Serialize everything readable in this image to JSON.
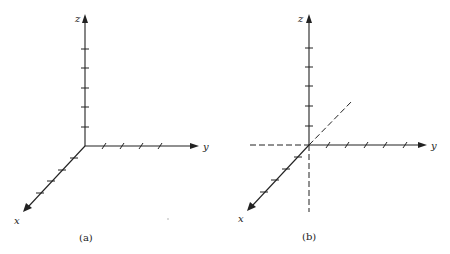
{
  "panels": [
    {
      "id": "a",
      "caption": "(a)",
      "labels": {
        "x": "x",
        "y": "y",
        "z": "z"
      },
      "origin": [
        85,
        146
      ],
      "z_tip": [
        85,
        14
      ],
      "y_tip": [
        199,
        146
      ],
      "x_tip": [
        23,
        212
      ],
      "z_ticks": [
        49,
        68,
        88,
        107,
        127
      ],
      "y_ticks": [
        104,
        122,
        141,
        160
      ],
      "x_ticks": [
        [
          74,
          158
        ],
        [
          62,
          170
        ],
        [
          51,
          181
        ],
        [
          40,
          193
        ]
      ],
      "negative_axes_dashed": false
    },
    {
      "id": "b",
      "caption": "(b)",
      "labels": {
        "x": "x",
        "y": "y",
        "z": "z"
      },
      "origin": [
        309,
        145
      ],
      "z_tip": [
        309,
        14
      ],
      "y_tip": [
        427,
        145
      ],
      "x_tip": [
        247,
        211
      ],
      "z_ticks": [
        48,
        67,
        86,
        106,
        126
      ],
      "y_ticks": [
        328,
        347,
        366,
        385,
        405
      ],
      "x_ticks": [
        [
          298,
          157
        ],
        [
          286,
          169
        ],
        [
          275,
          180
        ],
        [
          264,
          192
        ]
      ],
      "negative_axes_dashed": true,
      "neg_y_end": [
        250,
        145
      ],
      "neg_z_end": [
        309,
        212
      ],
      "neg_x_end": [
        353,
        100
      ]
    }
  ]
}
